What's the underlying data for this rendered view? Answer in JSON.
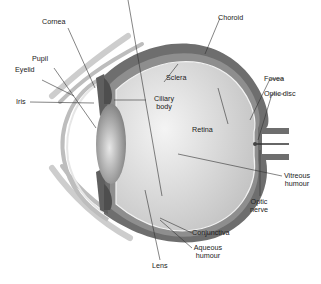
{
  "diagram": {
    "labels": {
      "cornea": "Cornea",
      "choroid": "Choroid",
      "pupil": "Pupil",
      "eyelid": "Eyelid",
      "sclera": "Sclera",
      "fovea": "Fovea",
      "optic_disc": "Optic disc",
      "iris": "Iris",
      "ciliary_body_1": "Ciliary",
      "ciliary_body_2": "body",
      "retina": "Retina",
      "vitreous_1": "Vitreous",
      "vitreous_2": "humour",
      "optic_nerve_1": "Optic",
      "optic_nerve_2": "nerve",
      "conjunctiva": "Conjunctiva",
      "aqueous_1": "Aqueous",
      "aqueous_2": "humour",
      "lens": "Lens"
    },
    "colors": {
      "sclera": "#6e6e6e",
      "choroid": "#8a8a8a",
      "vitreous": "#d6d6d6",
      "cornea": "#cfcfcf",
      "eyelid": "#c8c8c8",
      "lens": "#9a9a9a",
      "leader": "#333333"
    }
  }
}
